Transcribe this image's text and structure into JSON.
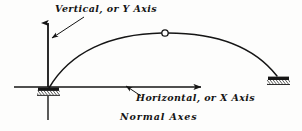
{
  "figure": {
    "caption": "Normal Axes",
    "labels": {
      "y_axis": "Vertical, or Y Axis",
      "x_axis": "Horizontal, or X Axis"
    },
    "colors": {
      "ink": "#151515",
      "background": "#fdfdfc",
      "hinge_fill": "#ffffff"
    }
  },
  "diagram_data": {
    "type": "engineering-line-diagram",
    "subject": "three-hinged arch on normal coordinate axes",
    "axes": {
      "origin": [
        48,
        87
      ],
      "y_axis": {
        "label": "Vertical, or Y Axis",
        "direction": "up",
        "arrow_tip": [
          48,
          19
        ],
        "tail": [
          48,
          87
        ],
        "negative_extension": [
          48,
          120
        ]
      },
      "x_axis": {
        "label": "Horizontal, or X Axis",
        "direction": "right",
        "arrow_tip": [
          205,
          87
        ],
        "tail": [
          14,
          87
        ]
      }
    },
    "arch": {
      "springing_left": [
        49,
        87
      ],
      "crown": [
        165,
        33
      ],
      "springing_right": [
        278,
        77
      ],
      "crown_hinge": {
        "center": [
          165,
          33
        ],
        "radius": 3.2,
        "style": "open-circle"
      }
    },
    "supports": [
      {
        "name": "left-support",
        "position": [
          48,
          90
        ],
        "style": "hatched-pin-base",
        "width": 22
      },
      {
        "name": "right-support",
        "position": [
          278,
          79
        ],
        "style": "hatched-pin-base",
        "width": 22
      }
    ],
    "leaders": [
      {
        "name": "y-axis-leader",
        "from": [
          84,
          17
        ],
        "to": [
          50,
          38
        ]
      },
      {
        "name": "x-axis-leader",
        "from": [
          140,
          95
        ],
        "to": [
          127,
          86
        ]
      }
    ]
  }
}
